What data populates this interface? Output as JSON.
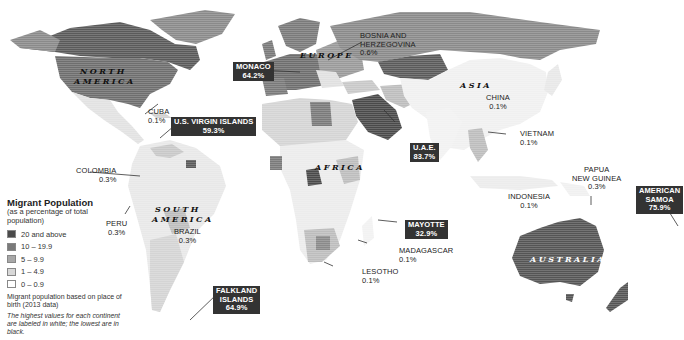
{
  "legend": {
    "title": "Migrant Population",
    "subtitle": "(as a percentage of total population)",
    "items": [
      {
        "label": "20 and above",
        "color": "#4a4a4a"
      },
      {
        "label": "10 – 19.9",
        "color": "#7a7a7a"
      },
      {
        "label": "5 – 9.9",
        "color": "#a8a8a8"
      },
      {
        "label": "1 – 4.9",
        "color": "#d8d8d8"
      },
      {
        "label": "0 – 0.9",
        "color": "#ffffff"
      }
    ],
    "note": "Migrant population based on place of birth (2013 data)",
    "italic_note": "The highest values for each continent are labeled in white; the lowest are in black."
  },
  "continents": {
    "north_america": "NORTH AMERICA",
    "north_america_l1": "NORTH",
    "north_america_l2": "AMERICA",
    "south_america_l1": "SOUTH",
    "south_america_l2": "AMERICA",
    "europe": "EUROPE",
    "africa": "AFRICA",
    "asia": "ASIA",
    "australia": "AUSTRALIA"
  },
  "highest": [
    {
      "name": "MONACO",
      "value": "64.2%"
    },
    {
      "name": "U.S. VIRGIN ISLANDS",
      "value": "59.3%"
    },
    {
      "name": "U.A.E.",
      "value": "83.7%"
    },
    {
      "name": "MAYOTTE",
      "value": "32.9%"
    },
    {
      "name_l1": "FALKLAND",
      "name_l2": "ISLANDS",
      "value": "64.9%"
    },
    {
      "name_l1": "AMERICAN",
      "name_l2": "SAMOA",
      "value": "75.9%"
    }
  ],
  "lowest": [
    {
      "name": "CUBA",
      "value": "0.1%"
    },
    {
      "name": "COLOMBIA",
      "value": "0.3%"
    },
    {
      "name": "PERU",
      "value": "0.3%"
    },
    {
      "name": "BRAZIL",
      "value": "0.3%"
    },
    {
      "name_l1": "BOSNIA AND",
      "name_l2": "HERZEGOVINA",
      "value": "0.6%"
    },
    {
      "name": "CHINA",
      "value": "0.1%"
    },
    {
      "name": "VIETNAM",
      "value": "0.1%"
    },
    {
      "name_l1": "PAPUA",
      "name_l2": "NEW GUINEA",
      "value": "0.3%"
    },
    {
      "name": "INDONESIA",
      "value": "0.1%"
    },
    {
      "name": "MADAGASCAR",
      "value": "0.1%"
    },
    {
      "name": "LESOTHO",
      "value": "0.1%"
    }
  ]
}
